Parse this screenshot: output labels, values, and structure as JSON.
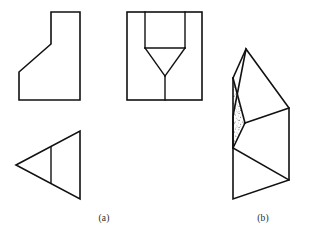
{
  "figure": {
    "caption_a": "(a)",
    "caption_b": "(b)",
    "caption_a_position": {
      "x": 104,
      "y": 221
    },
    "caption_b_position": {
      "x": 263,
      "y": 221
    },
    "stroke_color": "#111111",
    "background_color": "#ffffff",
    "stipple_color": "#5a5a5a",
    "views": [
      {
        "id": "front-view",
        "name": "front-view-stepped-block",
        "type": "orthographic-outline",
        "points": [
          [
            19,
            100
          ],
          [
            19,
            72
          ],
          [
            51,
            44
          ],
          [
            51,
            12
          ],
          [
            80,
            12
          ],
          [
            80,
            100
          ]
        ],
        "closed": true,
        "internal_lines": []
      },
      {
        "id": "top-view",
        "name": "top-view-triangle",
        "type": "orthographic-outline",
        "points": [
          [
            16,
            165
          ],
          [
            80,
            131
          ],
          [
            80,
            199
          ]
        ],
        "closed": true,
        "internal_lines": [
          [
            [
              51,
              147
            ],
            [
              51,
              183
            ]
          ]
        ]
      },
      {
        "id": "side-view",
        "name": "side-view-funnel",
        "type": "orthographic-outline",
        "points": [
          [
            127,
            12
          ],
          [
            202,
            12
          ],
          [
            202,
            100
          ],
          [
            127,
            100
          ]
        ],
        "closed": true,
        "internal_lines": [
          [
            [
              145,
              12
            ],
            [
              145,
              48
            ]
          ],
          [
            [
              185,
              12
            ],
            [
              185,
              48
            ]
          ],
          [
            [
              145,
              48
            ],
            [
              185,
              48
            ]
          ],
          [
            [
              145,
              48
            ],
            [
              165,
              76
            ]
          ],
          [
            [
              185,
              48
            ],
            [
              165,
              76
            ]
          ],
          [
            [
              165,
              76
            ],
            [
              165,
              100
            ]
          ]
        ]
      },
      {
        "id": "pictorial-view",
        "name": "isometric-pictorial-solid",
        "type": "isometric-solid",
        "outline": [
          [
            246,
            49
          ],
          [
            289,
            108
          ],
          [
            289,
            180
          ],
          [
            233,
            199
          ],
          [
            233,
            148
          ],
          [
            233,
            116
          ]
        ],
        "faces": [
          {
            "name": "top-face",
            "points": [
              [
                246,
                49
              ],
              [
                289,
                108
              ],
              [
                245,
                123
              ],
              [
                233,
                78
              ]
            ]
          },
          {
            "name": "shaded-inner-face",
            "points": [
              [
                233,
                78
              ],
              [
                245,
                123
              ],
              [
                233,
                148
              ]
            ],
            "shaded": true
          },
          {
            "name": "shaded-lower-face",
            "points": [
              [
                233,
                78
              ],
              [
                245,
                123
              ],
              [
                233,
                148
              ],
              [
                233,
                116
              ]
            ],
            "shaded": true
          }
        ],
        "internal_lines": [
          [
            [
              246,
              49
            ],
            [
              233,
              78
            ]
          ],
          [
            [
              233,
              78
            ],
            [
              245,
              123
            ]
          ],
          [
            [
              245,
              123
            ],
            [
              289,
              108
            ]
          ],
          [
            [
              245,
              123
            ],
            [
              233,
              148
            ]
          ],
          [
            [
              233,
              148
            ],
            [
              289,
              180
            ]
          ],
          [
            [
              233,
              78
            ],
            [
              233,
              148
            ]
          ]
        ]
      }
    ],
    "labels": [
      {
        "name": "view-label-a",
        "text": "(a)"
      },
      {
        "name": "view-label-b",
        "text": "(b)"
      }
    ]
  }
}
